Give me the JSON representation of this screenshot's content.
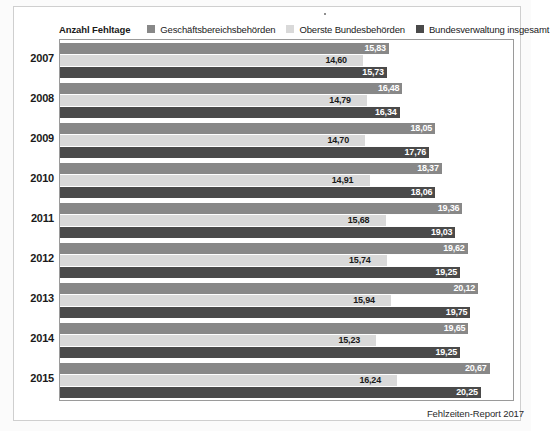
{
  "legend": {
    "title": "Anzahl Fehltage",
    "entries": [
      {
        "label": "Geschäftsbereichsbehörden",
        "color": "#888888"
      },
      {
        "label": "Oberste Bundesbehörden",
        "color": "#d9d9d9"
      },
      {
        "label": "Bundesverwaltung insgesamt",
        "color": "#4a4a4a"
      }
    ]
  },
  "footer": {
    "source": "Fehlzeiten-Report 2017",
    "marker": "bullet-dot"
  },
  "chart_data": {
    "type": "bar",
    "orientation": "horizontal",
    "title": "Anzahl Fehltage",
    "xlabel": "",
    "ylabel": "",
    "xlim": [
      0,
      21.8
    ],
    "grid": false,
    "legend_position": "top",
    "value_format": "german-decimal-comma",
    "categories": [
      "2007",
      "2008",
      "2009",
      "2010",
      "2011",
      "2012",
      "2013",
      "2014",
      "2015"
    ],
    "series": [
      {
        "name": "Geschäftsbereichsbehörden",
        "color": "#888888",
        "values": [
          15.83,
          16.48,
          18.05,
          18.37,
          19.36,
          19.62,
          20.12,
          19.65,
          20.67
        ],
        "labels": [
          "15,83",
          "16,48",
          "18,05",
          "18,37",
          "19,36",
          "19,62",
          "20,12",
          "19,65",
          "20,67"
        ]
      },
      {
        "name": "Oberste Bundesbehörden",
        "color": "#d9d9d9",
        "values": [
          14.6,
          14.79,
          14.7,
          14.91,
          15.68,
          15.74,
          15.94,
          15.23,
          16.24
        ],
        "labels": [
          "14,60",
          "14,79",
          "14,70",
          "14,91",
          "15,68",
          "15,74",
          "15,94",
          "15,23",
          "16,24"
        ]
      },
      {
        "name": "Bundesverwaltung insgesamt",
        "color": "#4a4a4a",
        "values": [
          15.73,
          16.34,
          17.76,
          18.06,
          19.03,
          19.25,
          19.75,
          19.25,
          20.25
        ],
        "labels": [
          "15,73",
          "16,34",
          "17,76",
          "18,06",
          "19,03",
          "19,25",
          "19,75",
          "19,25",
          "20,25"
        ]
      }
    ]
  }
}
